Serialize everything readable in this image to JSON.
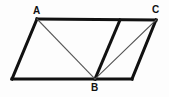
{
  "figure": {
    "kind": "geometry-diagram",
    "width": 169,
    "height": 97,
    "background_color": "#fdfdfd",
    "stroke_color": "#111111",
    "thin_stroke_color": "#555555",
    "labels": [
      {
        "id": "A",
        "text": "A",
        "x": 33,
        "y": 6
      },
      {
        "id": "C",
        "text": "C",
        "x": 152,
        "y": 5
      },
      {
        "id": "B",
        "text": "B",
        "x": 91,
        "y": 83
      }
    ],
    "points": {
      "A": {
        "x": 37,
        "y": 19
      },
      "C": {
        "x": 156,
        "y": 20
      },
      "B": {
        "x": 95,
        "y": 79
      },
      "D": {
        "x": 12,
        "y": 79
      },
      "E": {
        "x": 132,
        "y": 79
      },
      "F": {
        "x": 120,
        "y": 20
      }
    },
    "segments": [
      {
        "name": "top-edge-A-to-C",
        "from": "A",
        "to": "C",
        "weight": "thick"
      },
      {
        "name": "left-edge-A-to-D",
        "from": "A",
        "to": "D",
        "weight": "thick"
      },
      {
        "name": "bottom-edge-D-to-B",
        "from": "D",
        "to": "B",
        "weight": "thick"
      },
      {
        "name": "bottom-edge-B-to-E",
        "from": "B",
        "to": "E",
        "weight": "thick"
      },
      {
        "name": "right-edge-C-to-E",
        "from": "C",
        "to": "E",
        "weight": "thick"
      },
      {
        "name": "interior-F-to-B",
        "from": "F",
        "to": "B",
        "weight": "thick"
      },
      {
        "name": "diagonal-A-to-B",
        "from": "A",
        "to": "B",
        "weight": "thin"
      },
      {
        "name": "diagonal-C-to-B",
        "from": "C",
        "to": "B",
        "weight": "thin"
      }
    ]
  }
}
